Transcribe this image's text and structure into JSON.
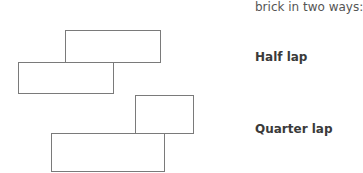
{
  "intro_text": "brick in two ways:",
  "diagrams": [
    {
      "label": "Half lap",
      "bricks": [
        {
          "x": 65,
          "y": 30,
          "w": 96,
          "h": 33
        },
        {
          "x": 18,
          "y": 62,
          "w": 96,
          "h": 32
        }
      ]
    },
    {
      "label": "Quarter lap",
      "bricks": [
        {
          "x": 135,
          "y": 95,
          "w": 59,
          "h": 39
        },
        {
          "x": 51,
          "y": 133,
          "w": 114,
          "h": 39
        }
      ]
    }
  ]
}
